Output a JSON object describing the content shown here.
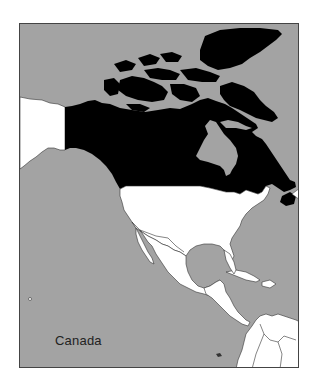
{
  "map": {
    "label": "Canada",
    "highlighted_country": "Canada",
    "colors": {
      "ocean": "#a3a3a3",
      "highlight": "#000000",
      "other_land": "#ffffff",
      "border": "#333333",
      "frame": "#444444",
      "label": "#222222"
    },
    "regions_shown": [
      "Alaska",
      "Canada",
      "United States",
      "Mexico",
      "Central America",
      "Caribbean",
      "Northern South America"
    ]
  }
}
